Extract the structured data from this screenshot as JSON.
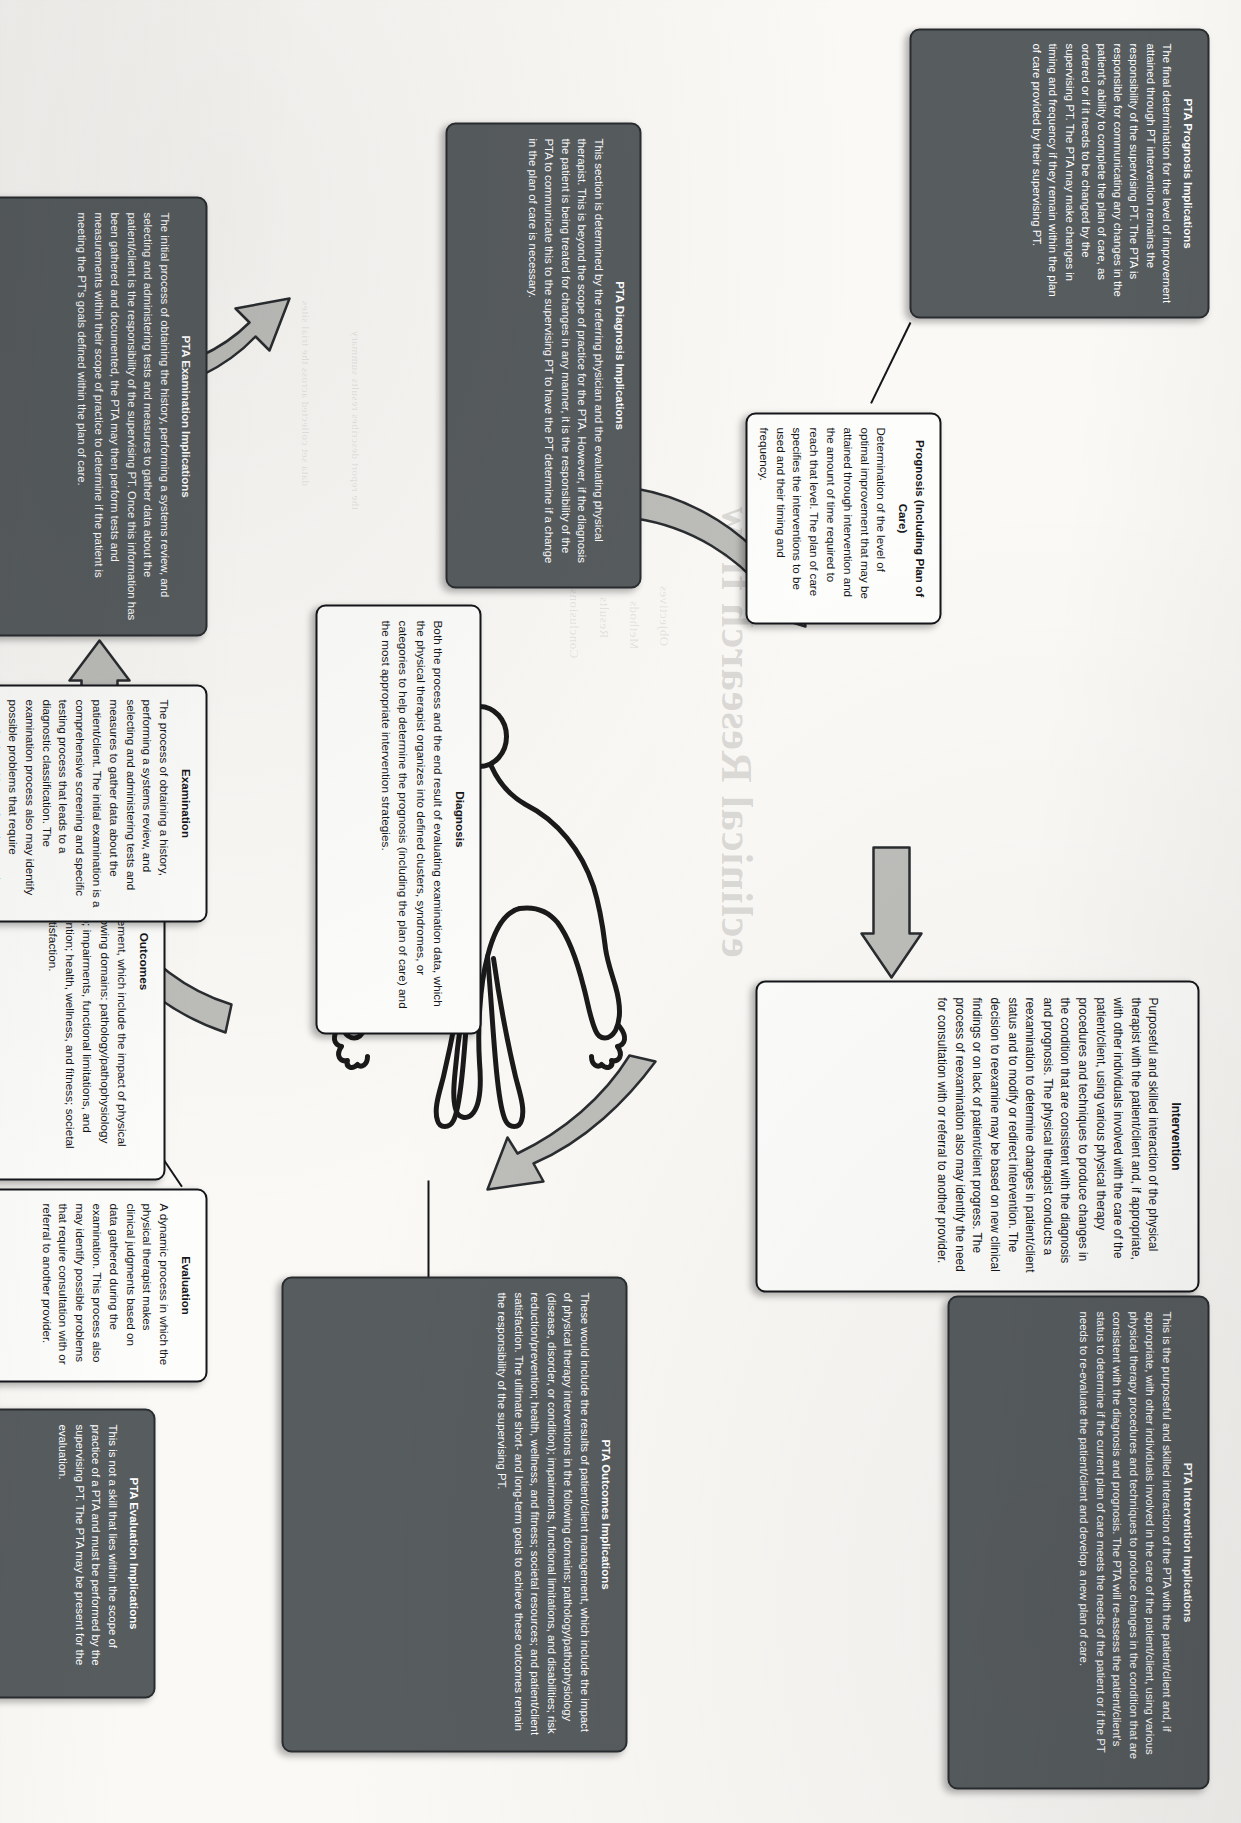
{
  "document": {
    "kind": "scanned-textbook-figure",
    "subject": "Patient/Client Management Model with PTA Implications"
  },
  "nodes": [
    {
      "id": "prognosis",
      "style": "white",
      "title": "Prognosis (Including Plan of Care)",
      "body": "Determination of the level of optimal improvement that may be attained through intervention and the amount of time required to reach that level. The plan of care specifies the interventions to be used and their timing and frequency."
    },
    {
      "id": "pta-prognosis",
      "style": "dark",
      "title": "PTA Prognosis Implications",
      "body": "The final determination for the level of improvement attained through PT intervention remains the responsibility of the supervising PT. The PTA is responsible for communicating any changes in the patient's ability to complete the plan of care, as ordered or if it needs to be changed by the supervising PT. The PTA may make changes in timing and frequency if they remain within the plan of care provided by their supervising PT."
    },
    {
      "id": "intervention",
      "style": "white",
      "title": "Intervention",
      "body": "Purposeful and skilled interaction of the physical therapist with the patient/client and, if appropriate, with other individuals involved with the care of the patient/client, using various physical therapy procedures and techniques to produce changes in the condition that are consistent with the diagnosis and prognosis. The physical therapist conducts a reexamination to determine changes in patient/client status and to modify or redirect intervention. The decision to reexamine may be based on new clinical findings or on lack of patient/client progress. The process of reexamination also may identify the need for consultation with or referral to another provider."
    },
    {
      "id": "pta-intervention",
      "style": "dark",
      "title": "PTA Intervention Implications",
      "body": "This is the purposeful and skilled interaction of the PTA with the patient/client and, if appropriate, with other individuals involved in the care of the patient/client, using various physical therapy procedures and techniques to produce changes in the condition that are consistent with the diagnosis and prognosis. The PTA will re-assess the patient/client's status to determine if the current plan of care meets the needs of the patient or if the PT needs to re-evaluate the patient/client and develop a new plan of care."
    },
    {
      "id": "diagnosis",
      "style": "white",
      "title": "Diagnosis",
      "body": "Both the process and the end result of evaluating examination data, which the physical therapist organizes into defined clusters, syndromes, or categories to help determine the prognosis (including the plan of care) and the most appropriate intervention strategies."
    },
    {
      "id": "pta-diagnosis",
      "style": "dark",
      "title": "PTA Diagnosis Implications",
      "body": "This section is determined by the referring physician and the evaluating physical therapist. This is beyond the scope of practice for the PTA. However, if the diagnosis the patient is being treated for changes in any manner, it is the responsibility of the PTA to communicate this to the supervising PT to have the PT determine if a change in the plan of care is necessary."
    },
    {
      "id": "outcomes",
      "style": "white",
      "title": "Outcomes",
      "body": "Results of patient/client management, which include the impact of physical therapy interventions in the following domains: pathology/pathophysiology (disease, disorder, or condition); impairments, functional limitations, and disabilities; risk reduction/prevention; health, wellness, and fitness; societal resources; and patient/client satisfaction."
    },
    {
      "id": "pta-outcomes",
      "style": "dark",
      "title": "PTA Outcomes Implications",
      "body": "These would include the results of patient/client management, which include the impact of physical therapy interventions in the following domains: pathology/pathophysiology (disease, disorder, or condition); impairments, functional limitations, and disabilities; risk reduction/prevention; health, wellness, and fitness; societal resources; and patient/client satisfaction. The ultimate short- and long-term goals to achieve these outcomes remain the responsibility of the supervising PT."
    },
    {
      "id": "evaluation",
      "style": "white",
      "title": "Evaluation",
      "body": "A dynamic process in which the physical therapist makes clinical judgments based on data gathered during the examination. This process also may identify possible problems that require consultation with or referral to another provider."
    },
    {
      "id": "pta-evaluation",
      "style": "dark",
      "title": "PTA Evaluation Implications",
      "body": "This is not a skill that lies within the scope of practice of a PTA and must be performed by the supervising PT. The PTA may be present for the evaluation."
    },
    {
      "id": "examination",
      "style": "white",
      "title": "Examination",
      "body": "The process of obtaining a history, performing a systems review, and selecting and administering tests and measures to gather data about the patient/client. The initial examination is a comprehensive screening and specific testing process that leads to a diagnostic classification. The examination process also may identify possible problems that require consultation with or referral to another provider."
    },
    {
      "id": "pta-examination",
      "style": "dark",
      "title": "PTA Examination Implications",
      "body": "The initial process of obtaining the history, performing a systems review, and selecting and administering tests and measures to gather data about the patient/client is the responsibility of the supervising PT. Once this information has been gathered and documented, the PTA may then perform tests and measurements within their scope of practice to determine if the patient is meeting the PT's goals defined within the plan of care."
    }
  ],
  "ghost_text": {
    "heading": "eclinical Research flow",
    "lines": [
      "Objectives",
      "Methods",
      "Results",
      "Conclusions"
    ]
  },
  "colors": {
    "dark_box_fill": "#575c5f",
    "dark_box_border": "#2a2d30",
    "white_box_fill": "#fdfdfb",
    "box_border": "#15161a",
    "arrow_fill": "#b9b9b6",
    "arrow_stroke": "#2a2d30",
    "paper": "#faf9f6"
  }
}
